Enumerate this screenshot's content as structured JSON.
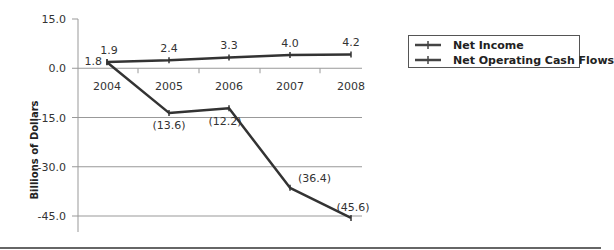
{
  "chart_data": {
    "type": "line",
    "title": "",
    "xlabel": "",
    "ylabel": "Billions of Dollars",
    "categories": [
      "2004",
      "2005",
      "2006",
      "2007",
      "2008"
    ],
    "series": [
      {
        "name": "Net Income",
        "values": [
          1.9,
          2.4,
          3.3,
          4.0,
          4.2
        ],
        "labels": [
          "1.9",
          "2.4",
          "3.3",
          "4.0",
          "4.2"
        ]
      },
      {
        "name": "Net Operating Cash Flows",
        "values": [
          1.8,
          -13.6,
          -12.2,
          -36.4,
          -45.6
        ],
        "labels": [
          "1.8",
          "(13.6)",
          "(12.2)",
          "(36.4)",
          "(45.6)"
        ]
      }
    ],
    "ylim": [
      -45,
      15
    ],
    "yticks": [
      15.0,
      0.0,
      -15.0,
      -30.0,
      -45.0
    ],
    "ytick_labels": [
      "15.0",
      "0.0",
      "-15.0",
      "-30.0",
      "-45.0"
    ],
    "grid": true,
    "legend_position": "right",
    "line_color": "#333333",
    "grid_color": "#999999"
  },
  "legend": {
    "items": [
      {
        "label": "Net Income"
      },
      {
        "label": "Net Operating Cash Flows"
      }
    ]
  }
}
